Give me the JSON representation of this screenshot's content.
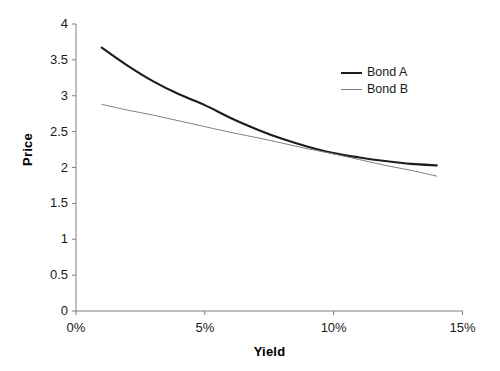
{
  "chart_data": {
    "type": "line",
    "title": "",
    "xlabel": "Yield",
    "ylabel": "Price",
    "xlim": [
      0,
      15
    ],
    "ylim": [
      0,
      4
    ],
    "grid": false,
    "legend_position": "upper-right-inside",
    "xtick_labels": [
      "0%",
      "5%",
      "10%",
      "15%"
    ],
    "xtick_values": [
      0,
      5,
      10,
      15
    ],
    "ytick_labels": [
      "0",
      "0.5",
      "1",
      "1.5",
      "2",
      "2.5",
      "3",
      "3.5",
      "4"
    ],
    "ytick_values": [
      0,
      0.5,
      1,
      1.5,
      2,
      2.5,
      3,
      3.5,
      4
    ],
    "x_unit": "percent",
    "series": [
      {
        "name": "Bond A",
        "color": "#1c1c1c",
        "line_width": 2.1,
        "style": "convex-curve",
        "x": [
          1.0,
          2.0,
          3.0,
          4.0,
          5.0,
          6.0,
          7.1,
          8.0,
          9.0,
          10.0,
          11.0,
          12.0,
          13.0,
          14.0
        ],
        "values": [
          3.67,
          3.42,
          3.2,
          3.02,
          2.87,
          2.69,
          2.52,
          2.4,
          2.29,
          2.2,
          2.14,
          2.09,
          2.05,
          2.03
        ]
      },
      {
        "name": "Bond B",
        "color": "#808080",
        "line_width": 1.0,
        "style": "straight-line",
        "x": [
          1.0,
          2.0,
          3.0,
          4.0,
          5.0,
          6.0,
          7.1,
          8.0,
          9.0,
          10.0,
          11.0,
          12.0,
          13.0,
          14.0
        ],
        "values": [
          2.88,
          2.8,
          2.73,
          2.65,
          2.57,
          2.49,
          2.41,
          2.34,
          2.26,
          2.19,
          2.11,
          2.03,
          1.96,
          1.88
        ]
      }
    ],
    "annotations": [],
    "axis_color": "#808080",
    "crossing_point": {
      "x": 7.1,
      "y": 2.41
    }
  },
  "legend": {
    "entries": [
      {
        "label": "Bond A"
      },
      {
        "label": "Bond B"
      }
    ]
  }
}
